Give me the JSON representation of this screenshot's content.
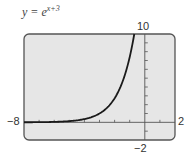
{
  "chart_data": {
    "type": "line",
    "title_base": "y = e",
    "title_exponent": "x+3",
    "xlabel": "",
    "ylabel": "",
    "xlim": [
      -8,
      2
    ],
    "ylim": [
      -2,
      10
    ],
    "xscl": 1,
    "yscl": 1,
    "grid": false,
    "tick_labels": {
      "xmin": "−8",
      "xmax": "2",
      "ymax": "10",
      "ymin": "−2"
    },
    "series": [
      {
        "name": "y = e^(x+3)",
        "x": [
          -8,
          -7,
          -6,
          -5,
          -4,
          -3,
          -2,
          -1,
          -0.697
        ],
        "y": [
          0.0067,
          0.018,
          0.05,
          0.135,
          0.368,
          1.0,
          2.718,
          7.389,
          10
        ]
      }
    ],
    "colors": {
      "frame_bg": "#e6e6e6",
      "frame_border": "#555555",
      "curve": "#1a1a1a",
      "axis": "#555555"
    }
  }
}
